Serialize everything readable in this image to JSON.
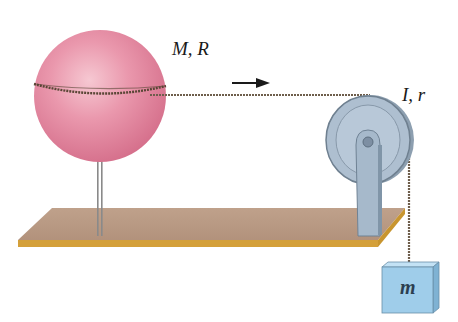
{
  "diagram": {
    "type": "physics-setup",
    "labels": {
      "sphere": "M, R",
      "pulley": "I, r",
      "block": "m"
    },
    "elements": {
      "sphere": {
        "description": "Hollow/solid sphere on vertical stand with string wound around equator",
        "color": "#e4879f"
      },
      "string": {
        "description": "String from sphere over pulley to hanging block",
        "color": "#6b5a48"
      },
      "arrow": {
        "description": "Direction of string motion (rightward)",
        "color": "#1a1a1a"
      },
      "pulley": {
        "description": "Pulley mounted on bracket at table edge",
        "color": "#a9bccd"
      },
      "table": {
        "description": "Horizontal board / tabletop",
        "color": "#b89a82",
        "edge_color": "#d2a038"
      },
      "block": {
        "description": "Hanging mass",
        "color": "#9ccbe8"
      }
    }
  }
}
